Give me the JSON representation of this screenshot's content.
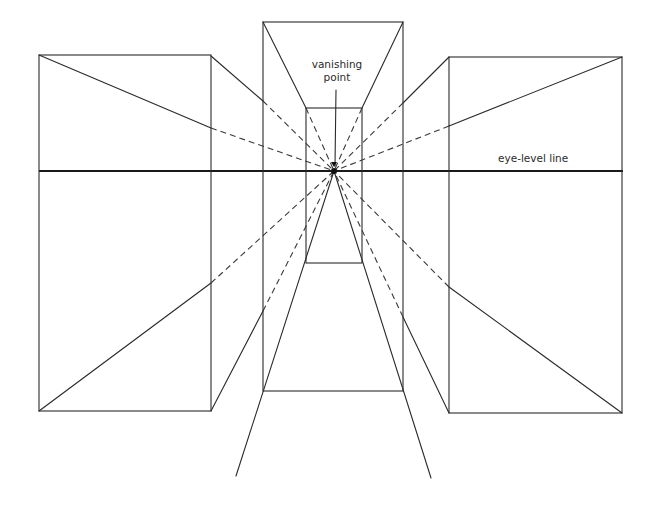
{
  "diagram": {
    "labels": {
      "vanishing_point_line1": "vanishing",
      "vanishing_point_line2": "point",
      "eye_level_line": "eye-level line"
    },
    "vanishing_point": {
      "x": 334,
      "y": 171
    },
    "eye_level_y": 171,
    "colors": {
      "ink": "#2a2a2a",
      "background": "#ffffff"
    },
    "boxes": [
      {
        "name": "left-box",
        "front": {
          "x1": 39,
          "y1": 55,
          "x2": 211,
          "y2": 411
        }
      },
      {
        "name": "center-box-outer",
        "front": {
          "x1": 263,
          "y1": 22,
          "x2": 403,
          "y2": 391
        }
      },
      {
        "name": "center-box-inner",
        "back": {
          "x1": 306,
          "y1": 108,
          "x2": 362,
          "y2": 263
        }
      },
      {
        "name": "right-box",
        "front": {
          "x1": 449,
          "y1": 57,
          "x2": 622,
          "y2": 413
        }
      }
    ]
  }
}
